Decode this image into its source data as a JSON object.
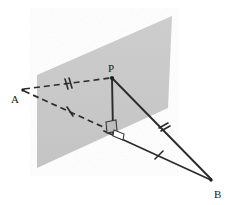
{
  "figure": {
    "background_color": "#ffffff",
    "plane": {
      "name": "shaded-plane",
      "fill_color": "#c9c9c9",
      "corners": [
        {
          "x": 37,
          "y": 75
        },
        {
          "x": 172,
          "y": 16
        },
        {
          "x": 168,
          "y": 108
        },
        {
          "x": 37,
          "y": 168
        }
      ]
    },
    "points": [
      {
        "id": "A",
        "label": "A",
        "x": 22,
        "y": 90,
        "label_x": 13,
        "label_y": 102
      },
      {
        "id": "P",
        "label": "P",
        "x": 112,
        "y": 77,
        "label_x": 109,
        "label_y": 69
      },
      {
        "id": "B",
        "label": "B",
        "x": 212,
        "y": 180,
        "label_x": 216,
        "label_y": 196
      },
      {
        "id": "F",
        "label": "",
        "x": 113,
        "y": 133,
        "label_x": 0,
        "label_y": 0
      }
    ],
    "segments": [
      {
        "id": "AP",
        "from": "A",
        "to": "P",
        "style": "dashed",
        "ticks": 2,
        "color": "#2b2b2b"
      },
      {
        "id": "AF",
        "from": "A",
        "to": "F",
        "style": "dashed",
        "ticks": 1,
        "color": "#2b2b2b"
      },
      {
        "id": "PF",
        "from": "P",
        "to": "F",
        "style": "solid",
        "ticks": 0,
        "color": "#2b2b2b"
      },
      {
        "id": "PB",
        "from": "P",
        "to": "B",
        "style": "solid",
        "ticks": 2,
        "color": "#2b2b2b"
      },
      {
        "id": "FB",
        "from": "F",
        "to": "B",
        "style": "solid",
        "ticks": 1,
        "color": "#2b2b2b"
      }
    ],
    "tick_marks": [
      {
        "id": "tick-AP",
        "on": "AP",
        "count": 2,
        "x": 68,
        "y": 83
      },
      {
        "id": "tick-AF",
        "on": "AF",
        "count": 1,
        "x": 70,
        "y": 112
      },
      {
        "id": "tick-PB",
        "on": "PB",
        "count": 2,
        "x": 164,
        "y": 128
      },
      {
        "id": "tick-FB",
        "on": "FB",
        "count": 1,
        "x": 159,
        "y": 155
      }
    ],
    "right_angle_markers": [
      {
        "id": "right-angle-in-plane",
        "at": "F",
        "note": "square marker on the plane at foot of perpendicular"
      },
      {
        "id": "right-angle-to-FB",
        "at": "F",
        "note": "square marker between PF and FB"
      }
    ],
    "stroke_color": "#2b2b2b",
    "label_color": "#1a1a1a"
  }
}
